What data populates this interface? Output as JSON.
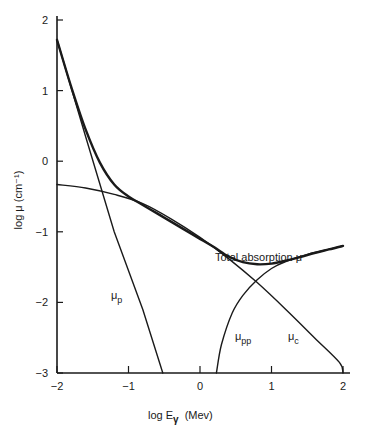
{
  "chart_data": {
    "type": "line",
    "title": "",
    "xlabel": "log Eγ (Mev)",
    "ylabel": "log μ (cm⁻¹)",
    "xlim": [
      -2,
      2
    ],
    "ylim": [
      -3,
      2
    ],
    "grid": false,
    "legend": "none (inline curve annotations)",
    "x_ticks": [
      "-2",
      "-1",
      "0",
      "1",
      "2"
    ],
    "y_ticks": [
      "2",
      "1",
      "0",
      "-1",
      "-2",
      "-3"
    ],
    "series": [
      {
        "name": "Total absorption μ",
        "x": [
          -2.0,
          -1.8,
          -1.6,
          -1.4,
          -1.2,
          -1.0,
          -0.8,
          -0.6,
          -0.4,
          -0.2,
          0.0,
          0.2,
          0.4,
          0.6,
          0.8,
          1.0,
          1.2,
          1.4,
          1.6,
          1.8,
          2.0
        ],
        "y": [
          1.72,
          1.05,
          0.45,
          -0.02,
          -0.33,
          -0.5,
          -0.62,
          -0.74,
          -0.86,
          -0.98,
          -1.1,
          -1.22,
          -1.35,
          -1.43,
          -1.46,
          -1.45,
          -1.41,
          -1.36,
          -1.3,
          -1.25,
          -1.2
        ]
      },
      {
        "name": "μp",
        "x": [
          -2.0,
          -1.6,
          -1.2,
          -0.8,
          -0.52
        ],
        "y": [
          1.72,
          0.35,
          -1.0,
          -2.1,
          -3.0
        ]
      },
      {
        "name": "μc",
        "x": [
          -2.0,
          -1.6,
          -1.2,
          -0.8,
          -0.4,
          0.0,
          0.4,
          0.8,
          1.2,
          1.6,
          1.95,
          2.0
        ],
        "y": [
          -0.33,
          -0.38,
          -0.47,
          -0.6,
          -0.82,
          -1.08,
          -1.38,
          -1.72,
          -2.1,
          -2.5,
          -2.85,
          -3.0
        ]
      },
      {
        "name": "μpp",
        "x": [
          0.23,
          0.3,
          0.45,
          0.6,
          0.8,
          1.0,
          1.2,
          1.5,
          1.8,
          2.0
        ],
        "y": [
          -3.0,
          -2.6,
          -2.15,
          -1.9,
          -1.68,
          -1.52,
          -1.42,
          -1.32,
          -1.25,
          -1.2
        ]
      }
    ],
    "annotations": [
      {
        "text": "Total absorption μ",
        "x": 0.1,
        "y": -0.97
      },
      {
        "text": "μp",
        "x": -1.17,
        "y": -1.75
      },
      {
        "text": "μpp",
        "x": 0.3,
        "y": -2.45
      },
      {
        "text": "μc",
        "x": 1.15,
        "y": -2.45
      }
    ]
  },
  "labels": {
    "y_axis_title": "log μ (cm⁻¹)",
    "x_axis_main": "log  E",
    "x_axis_sub": "γ",
    "x_axis_unit": "(Mev)",
    "total": "Total absorption μ",
    "mu": "μ",
    "sub_p": "p",
    "sub_pp": "pp",
    "sub_c": "c"
  }
}
